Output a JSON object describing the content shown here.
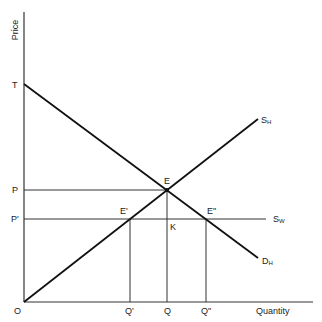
{
  "diagram": {
    "type": "supply-demand-tariff",
    "axes": {
      "y_label": "Price",
      "x_label": "Quantity",
      "origin_label": "O"
    },
    "price_labels": {
      "T": "T",
      "P": "P",
      "P_prime": "P'"
    },
    "quantity_labels": {
      "Q_prime": "Q'",
      "Q": "Q",
      "Q_double_prime": "Q\""
    },
    "point_labels": {
      "E": "E",
      "E_prime": "E'",
      "E_double_prime": "E\"",
      "K": "K"
    },
    "curves": {
      "home_supply": {
        "main": "S",
        "sub": "H"
      },
      "world_supply": {
        "main": "S",
        "sub": "W"
      },
      "home_demand": {
        "main": "D",
        "sub": "H"
      }
    }
  }
}
